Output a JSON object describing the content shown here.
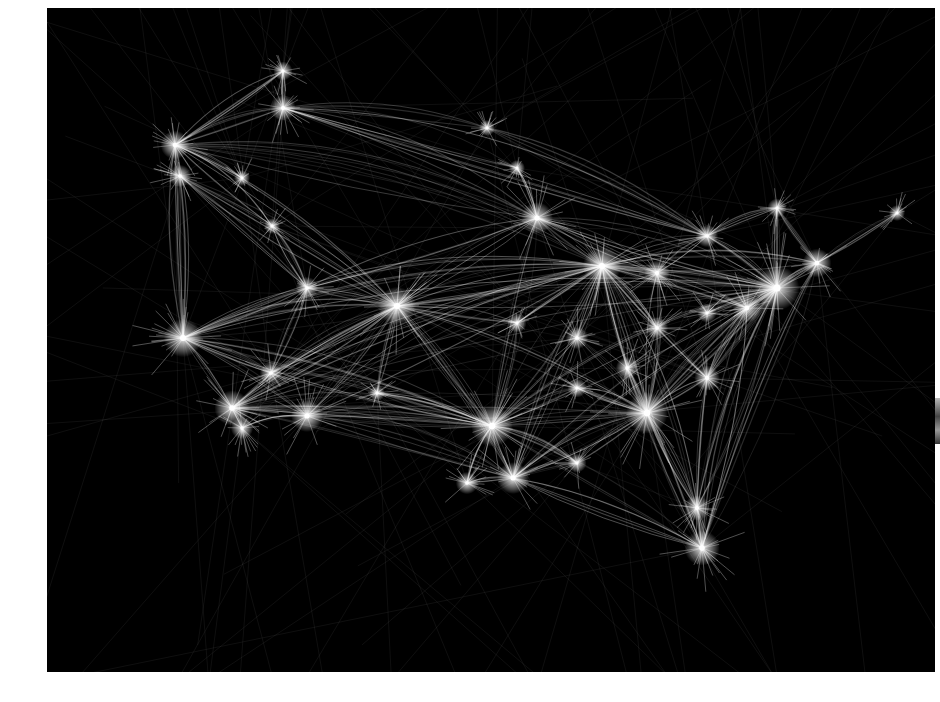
{
  "image": {
    "alt": "Flight paths over the United States rendered as white light trails on black",
    "background": "#000000",
    "trail_color": "#ffffff",
    "page_color": "#ffffff"
  },
  "hubs": [
    {
      "name": "seattle",
      "x": 128,
      "y": 137,
      "r": 9
    },
    {
      "name": "portland",
      "x": 133,
      "y": 168,
      "r": 7
    },
    {
      "name": "vancouver",
      "x": 236,
      "y": 63,
      "r": 6
    },
    {
      "name": "calgary",
      "x": 236,
      "y": 100,
      "r": 8
    },
    {
      "name": "edmonton",
      "x": 440,
      "y": 120,
      "r": 5
    },
    {
      "name": "minneapolis",
      "x": 490,
      "y": 210,
      "r": 10
    },
    {
      "name": "denver",
      "x": 350,
      "y": 298,
      "r": 12
    },
    {
      "name": "salt-lake-city",
      "x": 260,
      "y": 280,
      "r": 7
    },
    {
      "name": "san-francisco",
      "x": 136,
      "y": 330,
      "r": 12
    },
    {
      "name": "las-vegas",
      "x": 224,
      "y": 365,
      "r": 7
    },
    {
      "name": "los-angeles",
      "x": 185,
      "y": 400,
      "r": 11
    },
    {
      "name": "phoenix",
      "x": 260,
      "y": 408,
      "r": 10
    },
    {
      "name": "dallas",
      "x": 445,
      "y": 418,
      "r": 13
    },
    {
      "name": "houston",
      "x": 466,
      "y": 470,
      "r": 10
    },
    {
      "name": "kansas-city",
      "x": 470,
      "y": 315,
      "r": 6
    },
    {
      "name": "chicago",
      "x": 555,
      "y": 258,
      "r": 12
    },
    {
      "name": "detroit",
      "x": 610,
      "y": 265,
      "r": 8
    },
    {
      "name": "st-louis",
      "x": 530,
      "y": 330,
      "r": 7
    },
    {
      "name": "atlanta",
      "x": 600,
      "y": 405,
      "r": 13
    },
    {
      "name": "charlotte",
      "x": 660,
      "y": 370,
      "r": 8
    },
    {
      "name": "washington",
      "x": 700,
      "y": 300,
      "r": 9
    },
    {
      "name": "new-york",
      "x": 730,
      "y": 280,
      "r": 14
    },
    {
      "name": "boston",
      "x": 770,
      "y": 255,
      "r": 9
    },
    {
      "name": "toronto",
      "x": 660,
      "y": 228,
      "r": 7
    },
    {
      "name": "montreal",
      "x": 730,
      "y": 200,
      "r": 6
    },
    {
      "name": "orlando",
      "x": 650,
      "y": 500,
      "r": 8
    },
    {
      "name": "miami",
      "x": 655,
      "y": 540,
      "r": 11
    },
    {
      "name": "nashville",
      "x": 580,
      "y": 360,
      "r": 7
    },
    {
      "name": "memphis",
      "x": 530,
      "y": 380,
      "r": 6
    },
    {
      "name": "new-orleans",
      "x": 530,
      "y": 455,
      "r": 6
    },
    {
      "name": "san-antonio",
      "x": 420,
      "y": 475,
      "r": 7
    },
    {
      "name": "albuquerque",
      "x": 330,
      "y": 385,
      "r": 5
    },
    {
      "name": "pittsburgh",
      "x": 660,
      "y": 305,
      "r": 6
    },
    {
      "name": "cincinnati",
      "x": 610,
      "y": 320,
      "r": 7
    },
    {
      "name": "san-diego",
      "x": 195,
      "y": 420,
      "r": 7
    },
    {
      "name": "boise",
      "x": 225,
      "y": 218,
      "r": 5
    },
    {
      "name": "spokane",
      "x": 195,
      "y": 170,
      "r": 5
    },
    {
      "name": "winnipeg",
      "x": 470,
      "y": 160,
      "r": 5
    },
    {
      "name": "halifax",
      "x": 850,
      "y": 205,
      "r": 5
    }
  ],
  "routes": [
    [
      "seattle",
      "portland"
    ],
    [
      "seattle",
      "calgary"
    ],
    [
      "seattle",
      "vancouver"
    ],
    [
      "vancouver",
      "calgary"
    ],
    [
      "seattle",
      "denver"
    ],
    [
      "seattle",
      "minneapolis"
    ],
    [
      "seattle",
      "chicago"
    ],
    [
      "seattle",
      "san-francisco"
    ],
    [
      "portland",
      "san-francisco"
    ],
    [
      "portland",
      "denver"
    ],
    [
      "portland",
      "salt-lake-city"
    ],
    [
      "san-francisco",
      "los-angeles"
    ],
    [
      "san-francisco",
      "las-vegas"
    ],
    [
      "san-francisco",
      "denver"
    ],
    [
      "san-francisco",
      "chicago"
    ],
    [
      "san-francisco",
      "dallas"
    ],
    [
      "san-francisco",
      "new-york"
    ],
    [
      "san-francisco",
      "phoenix"
    ],
    [
      "san-francisco",
      "salt-lake-city"
    ],
    [
      "los-angeles",
      "phoenix"
    ],
    [
      "los-angeles",
      "las-vegas"
    ],
    [
      "los-angeles",
      "denver"
    ],
    [
      "los-angeles",
      "dallas"
    ],
    [
      "los-angeles",
      "chicago"
    ],
    [
      "los-angeles",
      "new-york"
    ],
    [
      "los-angeles",
      "atlanta"
    ],
    [
      "los-angeles",
      "houston"
    ],
    [
      "los-angeles",
      "san-diego"
    ],
    [
      "san-diego",
      "phoenix"
    ],
    [
      "phoenix",
      "dallas"
    ],
    [
      "phoenix",
      "denver"
    ],
    [
      "phoenix",
      "chicago"
    ],
    [
      "phoenix",
      "houston"
    ],
    [
      "las-vegas",
      "denver"
    ],
    [
      "las-vegas",
      "chicago"
    ],
    [
      "las-vegas",
      "dallas"
    ],
    [
      "salt-lake-city",
      "denver"
    ],
    [
      "salt-lake-city",
      "las-vegas"
    ],
    [
      "salt-lake-city",
      "minneapolis"
    ],
    [
      "calgary",
      "minneapolis"
    ],
    [
      "calgary",
      "toronto"
    ],
    [
      "calgary",
      "edmonton"
    ],
    [
      "edmonton",
      "toronto"
    ],
    [
      "minneapolis",
      "chicago"
    ],
    [
      "minneapolis",
      "denver"
    ],
    [
      "minneapolis",
      "detroit"
    ],
    [
      "minneapolis",
      "new-york"
    ],
    [
      "minneapolis",
      "dallas"
    ],
    [
      "denver",
      "chicago"
    ],
    [
      "denver",
      "dallas"
    ],
    [
      "denver",
      "kansas-city"
    ],
    [
      "denver",
      "houston"
    ],
    [
      "denver",
      "atlanta"
    ],
    [
      "denver",
      "new-york"
    ],
    [
      "denver",
      "albuquerque"
    ],
    [
      "albuquerque",
      "dallas"
    ],
    [
      "kansas-city",
      "chicago"
    ],
    [
      "kansas-city",
      "dallas"
    ],
    [
      "chicago",
      "detroit"
    ],
    [
      "chicago",
      "new-york"
    ],
    [
      "chicago",
      "washington"
    ],
    [
      "chicago",
      "atlanta"
    ],
    [
      "chicago",
      "dallas"
    ],
    [
      "chicago",
      "st-louis"
    ],
    [
      "chicago",
      "boston"
    ],
    [
      "chicago",
      "toronto"
    ],
    [
      "chicago",
      "cincinnati"
    ],
    [
      "chicago",
      "charlotte"
    ],
    [
      "chicago",
      "miami"
    ],
    [
      "chicago",
      "houston"
    ],
    [
      "st-louis",
      "dallas"
    ],
    [
      "st-louis",
      "atlanta"
    ],
    [
      "dallas",
      "houston"
    ],
    [
      "dallas",
      "atlanta"
    ],
    [
      "dallas",
      "san-antonio"
    ],
    [
      "dallas",
      "memphis"
    ],
    [
      "dallas",
      "new-york"
    ],
    [
      "dallas",
      "miami"
    ],
    [
      "dallas",
      "new-orleans"
    ],
    [
      "houston",
      "atlanta"
    ],
    [
      "houston",
      "new-orleans"
    ],
    [
      "houston",
      "san-antonio"
    ],
    [
      "houston",
      "miami"
    ],
    [
      "houston",
      "new-york"
    ],
    [
      "atlanta",
      "charlotte"
    ],
    [
      "atlanta",
      "washington"
    ],
    [
      "atlanta",
      "new-york"
    ],
    [
      "atlanta",
      "orlando"
    ],
    [
      "atlanta",
      "miami"
    ],
    [
      "atlanta",
      "nashville"
    ],
    [
      "atlanta",
      "memphis"
    ],
    [
      "atlanta",
      "new-orleans"
    ],
    [
      "nashville",
      "chicago"
    ],
    [
      "charlotte",
      "washington"
    ],
    [
      "charlotte",
      "new-york"
    ],
    [
      "charlotte",
      "orlando"
    ],
    [
      "washington",
      "new-york"
    ],
    [
      "washington",
      "boston"
    ],
    [
      "new-york",
      "boston"
    ],
    [
      "new-york",
      "toronto"
    ],
    [
      "new-york",
      "montreal"
    ],
    [
      "new-york",
      "orlando"
    ],
    [
      "new-york",
      "miami"
    ],
    [
      "boston",
      "montreal"
    ],
    [
      "boston",
      "halifax"
    ],
    [
      "montreal",
      "toronto"
    ],
    [
      "toronto",
      "detroit"
    ],
    [
      "detroit",
      "new-york"
    ],
    [
      "detroit",
      "atlanta"
    ],
    [
      "pittsburgh",
      "new-york"
    ],
    [
      "cincinnati",
      "atlanta"
    ],
    [
      "orlando",
      "miami"
    ],
    [
      "washington",
      "miami"
    ],
    [
      "boston",
      "miami"
    ],
    [
      "spokane",
      "seattle"
    ],
    [
      "boise",
      "salt-lake-city"
    ],
    [
      "boise",
      "seattle"
    ],
    [
      "winnipeg",
      "minneapolis"
    ],
    [
      "winnipeg",
      "calgary"
    ]
  ],
  "outbound_rays": {
    "description": "faint trails leaving the frame toward oceans",
    "count": 140
  }
}
